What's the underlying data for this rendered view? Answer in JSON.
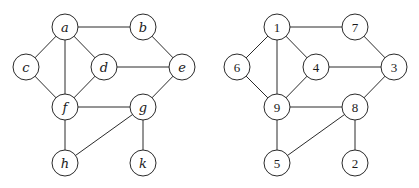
{
  "graphs": [
    {
      "name": "graph-letters",
      "label_style": "italic",
      "radius": 13,
      "nodes": [
        {
          "id": "a",
          "label": "a",
          "x": 65,
          "y": 27
        },
        {
          "id": "b",
          "label": "b",
          "x": 143,
          "y": 27
        },
        {
          "id": "c",
          "label": "c",
          "x": 26,
          "y": 67
        },
        {
          "id": "d",
          "label": "d",
          "x": 104,
          "y": 67
        },
        {
          "id": "e",
          "label": "e",
          "x": 182,
          "y": 67
        },
        {
          "id": "f",
          "label": "f",
          "x": 65,
          "y": 107
        },
        {
          "id": "g",
          "label": "g",
          "x": 143,
          "y": 107
        },
        {
          "id": "h",
          "label": "h",
          "x": 65,
          "y": 163
        },
        {
          "id": "k",
          "label": "k",
          "x": 143,
          "y": 163
        }
      ],
      "edges": [
        [
          "a",
          "b"
        ],
        [
          "a",
          "c"
        ],
        [
          "a",
          "d"
        ],
        [
          "a",
          "f"
        ],
        [
          "b",
          "e"
        ],
        [
          "c",
          "f"
        ],
        [
          "d",
          "e"
        ],
        [
          "d",
          "f"
        ],
        [
          "e",
          "g"
        ],
        [
          "f",
          "g"
        ],
        [
          "f",
          "h"
        ],
        [
          "g",
          "h"
        ],
        [
          "g",
          "k"
        ]
      ]
    },
    {
      "name": "graph-numbers",
      "label_style": "numeric",
      "radius": 13,
      "nodes": [
        {
          "id": "1",
          "label": "1",
          "x": 277,
          "y": 27
        },
        {
          "id": "7",
          "label": "7",
          "x": 355,
          "y": 27
        },
        {
          "id": "6",
          "label": "6",
          "x": 237,
          "y": 67
        },
        {
          "id": "4",
          "label": "4",
          "x": 316,
          "y": 67
        },
        {
          "id": "3",
          "label": "3",
          "x": 394,
          "y": 67
        },
        {
          "id": "9",
          "label": "9",
          "x": 277,
          "y": 107
        },
        {
          "id": "8",
          "label": "8",
          "x": 355,
          "y": 107
        },
        {
          "id": "5",
          "label": "5",
          "x": 277,
          "y": 163
        },
        {
          "id": "2",
          "label": "2",
          "x": 355,
          "y": 163
        }
      ],
      "edges": [
        [
          "1",
          "7"
        ],
        [
          "1",
          "6"
        ],
        [
          "1",
          "4"
        ],
        [
          "1",
          "9"
        ],
        [
          "7",
          "3"
        ],
        [
          "6",
          "9"
        ],
        [
          "4",
          "3"
        ],
        [
          "4",
          "9"
        ],
        [
          "3",
          "8"
        ],
        [
          "9",
          "8"
        ],
        [
          "9",
          "5"
        ],
        [
          "8",
          "5"
        ],
        [
          "8",
          "2"
        ]
      ]
    }
  ]
}
